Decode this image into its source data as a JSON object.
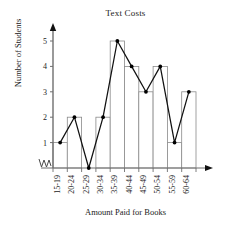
{
  "chart_data": {
    "type": "bar",
    "title": "Text Costs",
    "xlabel": "Amount Paid for Books",
    "ylabel": "Number of Students",
    "categories": [
      "15-19",
      "20-24",
      "25-29",
      "30-34",
      "35-39",
      "40-44",
      "45-49",
      "50-54",
      "55-59",
      "60-64"
    ],
    "values": [
      1,
      2,
      0,
      2,
      5,
      4,
      3,
      4,
      1,
      3
    ],
    "ylim": [
      0,
      5
    ],
    "ytick_labels": [
      "1",
      "2",
      "3",
      "4",
      "5"
    ],
    "ytick_values": [
      1,
      2,
      3,
      4,
      5
    ],
    "grid": false,
    "legend": "none",
    "series": [
      {
        "name": "Number of Students",
        "values": [
          1,
          2,
          0,
          2,
          5,
          4,
          3,
          4,
          1,
          3
        ],
        "style": "histogram-bars"
      },
      {
        "name": "Frequency polygon",
        "values": [
          1,
          2,
          0,
          2,
          5,
          4,
          3,
          4,
          1,
          3
        ],
        "style": "line-with-markers"
      }
    ],
    "annotations": {
      "axis_break": "zigzag break on x-axis near origin",
      "x_axis_arrow": "right arrowhead",
      "y_axis_arrow": "up arrowhead",
      "xtick_rotation": "-90"
    },
    "colors": {
      "bar_stroke": "#8a8a8a",
      "bar_fill": "#ffffff",
      "line": "#111111",
      "marker": "#000000",
      "axis": "#6f6f6f",
      "text": "#222222"
    }
  }
}
